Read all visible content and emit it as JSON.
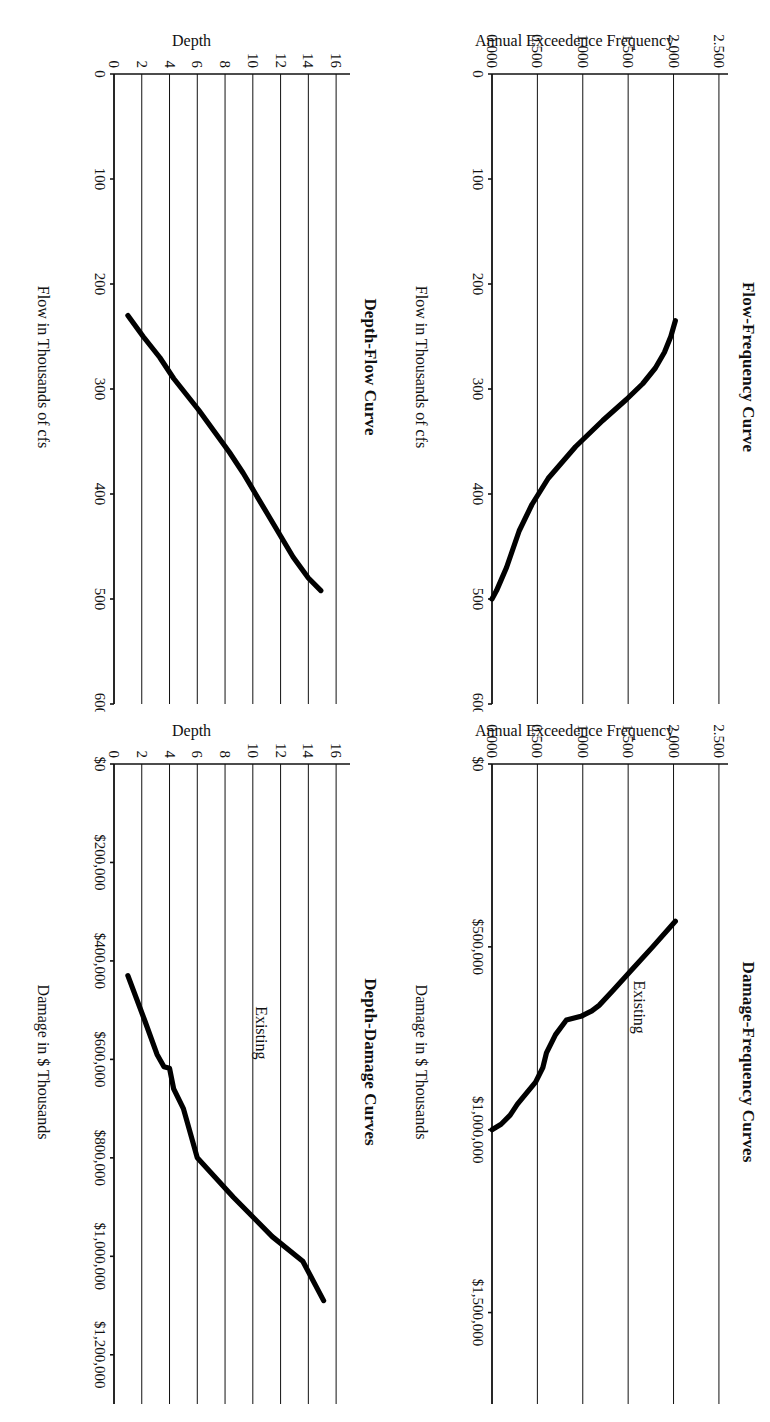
{
  "page": {
    "orientation": "rotated-90",
    "background": "#ffffff",
    "ink": "#111111"
  },
  "charts": [
    {
      "id": "depth-flow",
      "title": "Depth-Flow Curve",
      "xlabel": "Flow in Thousands of cfs",
      "ylabel": "Depth",
      "xticks": [
        "0",
        "100",
        "200",
        "300",
        "400",
        "500",
        "600"
      ],
      "yticks": [
        "0",
        "2",
        "4",
        "6",
        "8",
        "10",
        "12",
        "14",
        "16"
      ],
      "annotation": ""
    },
    {
      "id": "depth-damage",
      "title": "Depth-Damage Curves",
      "xlabel": "Damage in $ Thousands",
      "ylabel": "Depth",
      "xticks": [
        "$0",
        "$200,000",
        "$400,000",
        "$600,000",
        "$800,000",
        "$1,000,000",
        "$1,200,000"
      ],
      "yticks": [
        "0",
        "2",
        "4",
        "6",
        "8",
        "10",
        "12",
        "14",
        "16"
      ],
      "annotation": "Existing"
    },
    {
      "id": "flow-freq",
      "title": "Flow-Frequency Curve",
      "xlabel": "Flow in Thousands of cfs",
      "ylabel": "Annual Exceedence Frequency",
      "xticks": [
        "0",
        "100",
        "200",
        "300",
        "400",
        "500",
        "600"
      ],
      "yticks": [
        "0.000",
        "0.500",
        "1.000",
        "1.500",
        "2.000",
        "2.500"
      ],
      "annotation": ""
    },
    {
      "id": "damage-freq",
      "title": "Damage-Frequency Curves",
      "xlabel": "Damage in $ Thousands",
      "ylabel": "Annual Exceedence Frequency",
      "xticks": [
        "$0",
        "$500,000",
        "$1,000,000",
        "$1,500,000"
      ],
      "yticks": [
        "0.000",
        "0.500",
        "1.000",
        "1.500",
        "2.000",
        "2.500"
      ],
      "annotation": "Existing"
    }
  ],
  "chart_data": [
    {
      "type": "line",
      "id": "depth-flow",
      "title": "Depth-Flow Curve",
      "xlabel": "Flow in Thousands of cfs",
      "ylabel": "Depth",
      "xlim": [
        0,
        600
      ],
      "ylim": [
        0,
        17
      ],
      "xticks": [
        0,
        100,
        200,
        300,
        400,
        500,
        600
      ],
      "yticks": [
        0,
        2,
        4,
        6,
        8,
        10,
        12,
        14,
        16
      ],
      "grid": "horizontal",
      "legend": "none",
      "series": [
        {
          "name": "Depth-Flow",
          "x": [
            230,
            250,
            270,
            290,
            300,
            320,
            340,
            360,
            380,
            400,
            420,
            440,
            460,
            480,
            492
          ],
          "y": [
            1.0,
            2.1,
            3.3,
            4.3,
            4.9,
            6.1,
            7.2,
            8.3,
            9.3,
            10.2,
            11.1,
            12.0,
            12.9,
            14.0,
            14.9
          ]
        }
      ]
    },
    {
      "type": "line",
      "id": "depth-damage",
      "title": "Depth-Damage Curves",
      "xlabel": "Damage in $ Thousands",
      "ylabel": "Depth",
      "xlim": [
        0,
        1300000
      ],
      "ylim": [
        0,
        17
      ],
      "xticks": [
        0,
        200000,
        400000,
        600000,
        800000,
        1000000,
        1200000
      ],
      "yticks": [
        0,
        2,
        4,
        6,
        8,
        10,
        12,
        14,
        16
      ],
      "grid": "horizontal",
      "legend": "inline-annotation",
      "series": [
        {
          "name": "Existing",
          "x": [
            430000,
            520000,
            590000,
            615000,
            618000,
            660000,
            700000,
            760000,
            800000,
            880000,
            960000,
            1010000,
            1090000
          ],
          "y": [
            1.0,
            2.2,
            3.1,
            3.6,
            4.0,
            4.3,
            5.0,
            5.6,
            6.0,
            8.6,
            11.4,
            13.6,
            15.1
          ]
        }
      ]
    },
    {
      "type": "line",
      "id": "flow-freq",
      "title": "Flow-Frequency Curve",
      "xlabel": "Flow in Thousands of cfs",
      "ylabel": "Annual Exceedence Frequency",
      "xlim": [
        0,
        600
      ],
      "ylim": [
        0,
        2.6
      ],
      "xticks": [
        0,
        100,
        200,
        300,
        400,
        500,
        600
      ],
      "yticks": [
        0.0,
        0.5,
        1.0,
        1.5,
        2.0,
        2.5
      ],
      "grid": "horizontal",
      "legend": "none",
      "series": [
        {
          "name": "Flow-Frequency",
          "x": [
            235,
            250,
            265,
            280,
            295,
            310,
            330,
            355,
            385,
            410,
            435,
            455,
            470,
            482,
            492,
            500
          ],
          "y": [
            2.02,
            1.97,
            1.9,
            1.8,
            1.66,
            1.48,
            1.22,
            0.92,
            0.62,
            0.44,
            0.3,
            0.22,
            0.16,
            0.1,
            0.05,
            0.0
          ]
        }
      ]
    },
    {
      "type": "line",
      "id": "damage-freq",
      "title": "Damage-Frequency Curves",
      "xlabel": "Damage in $ Thousands",
      "ylabel": "Annual Exceedence Frequency",
      "xlim": [
        0,
        1750000
      ],
      "ylim": [
        0,
        2.6
      ],
      "xticks": [
        0,
        500000,
        1000000,
        1500000
      ],
      "yticks": [
        0.0,
        0.5,
        1.0,
        1.5,
        2.0,
        2.5
      ],
      "grid": "horizontal",
      "legend": "inline-annotation",
      "series": [
        {
          "name": "Existing",
          "x": [
            430000,
            500000,
            560000,
            620000,
            660000,
            675000,
            690000,
            700000,
            740000,
            790000,
            830000,
            870000,
            900000,
            930000,
            960000,
            985000,
            1000000
          ],
          "y": [
            2.02,
            1.77,
            1.55,
            1.33,
            1.18,
            1.1,
            0.98,
            0.82,
            0.7,
            0.6,
            0.56,
            0.48,
            0.38,
            0.28,
            0.2,
            0.1,
            0.0
          ]
        }
      ]
    }
  ]
}
